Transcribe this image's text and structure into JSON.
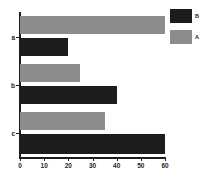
{
  "chart_data": {
    "type": "bar",
    "orientation": "horizontal",
    "title": "",
    "xlabel": "",
    "ylabel": "",
    "categories": [
      "a",
      "b",
      "c"
    ],
    "series": [
      {
        "name": "A",
        "color": "#8c8c8c",
        "values": [
          60,
          25,
          35
        ]
      },
      {
        "name": "B",
        "color": "#1c1c1c",
        "values": [
          20,
          40,
          60
        ]
      }
    ],
    "xlim": [
      0,
      60
    ],
    "xticks": [
      0,
      10,
      20,
      30,
      40,
      50,
      60
    ],
    "xtick_labels": [
      "0",
      "10",
      "20",
      "30",
      "40",
      "50",
      "60"
    ],
    "ytick_labels": [
      "a",
      "b",
      "c"
    ],
    "grid": false,
    "legend": {
      "position": "top-right",
      "entries": [
        {
          "label": "B",
          "color": "#1c1c1c"
        },
        {
          "label": "A",
          "color": "#8c8c8c"
        }
      ]
    }
  },
  "axis": {
    "tick_0": "0",
    "tick_10": "10",
    "tick_20": "20",
    "tick_30": "30",
    "tick_40": "40",
    "tick_50": "50",
    "tick_60": "60",
    "cat_a": "a",
    "cat_b": "b",
    "cat_c": "c"
  },
  "legend": {
    "label_b": "B",
    "label_a": "A"
  },
  "colors": {
    "series_a": "#8c8c8c",
    "series_b": "#1c1c1c",
    "axis": "#1c1c1c",
    "background": "#ffffff"
  }
}
